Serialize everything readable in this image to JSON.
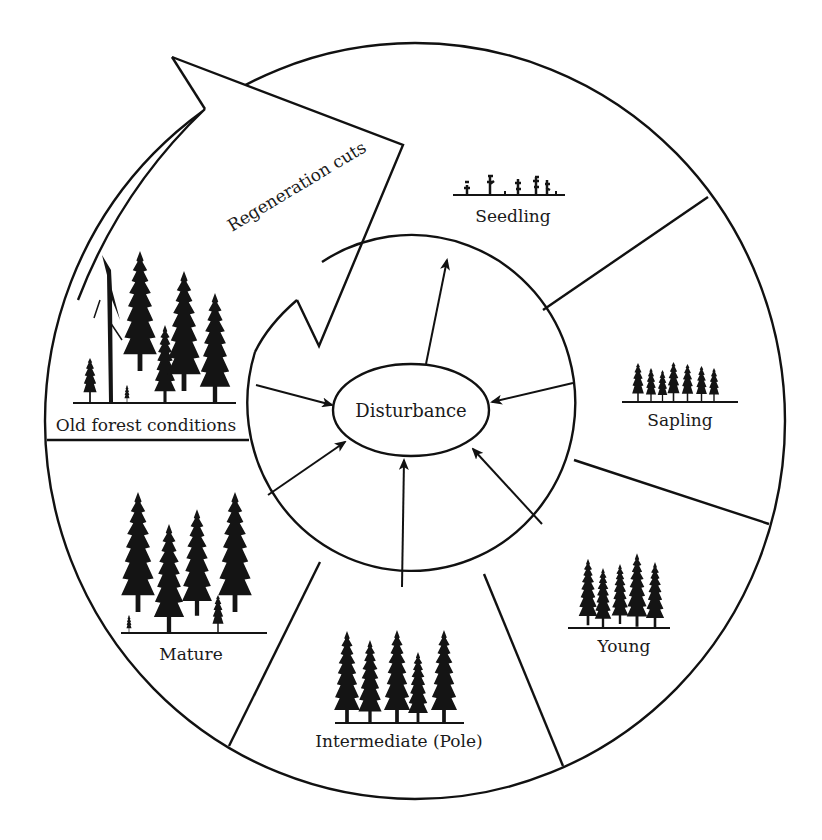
{
  "diagram": {
    "center": {
      "label": "Disturbance"
    },
    "arrow": {
      "label": "Regeneration cuts"
    },
    "stages": [
      {
        "id": "seedling",
        "label": "Seedling"
      },
      {
        "id": "sapling",
        "label": "Sapling"
      },
      {
        "id": "young",
        "label": "Young"
      },
      {
        "id": "intermediate",
        "label": "Intermediate (Pole)"
      },
      {
        "id": "mature",
        "label": "Mature"
      },
      {
        "id": "old",
        "label": "Old forest conditions"
      }
    ],
    "flows": [
      {
        "from": "old",
        "to": "Disturbance"
      },
      {
        "from": "mature",
        "to": "Disturbance"
      },
      {
        "from": "intermediate",
        "to": "Disturbance"
      },
      {
        "from": "young",
        "to": "Disturbance"
      },
      {
        "from": "sapling",
        "to": "Disturbance"
      },
      {
        "from": "Disturbance",
        "to": "seedling"
      }
    ],
    "colors": {
      "stroke": "#111111",
      "tree": "#141414",
      "background": "#ffffff"
    }
  }
}
